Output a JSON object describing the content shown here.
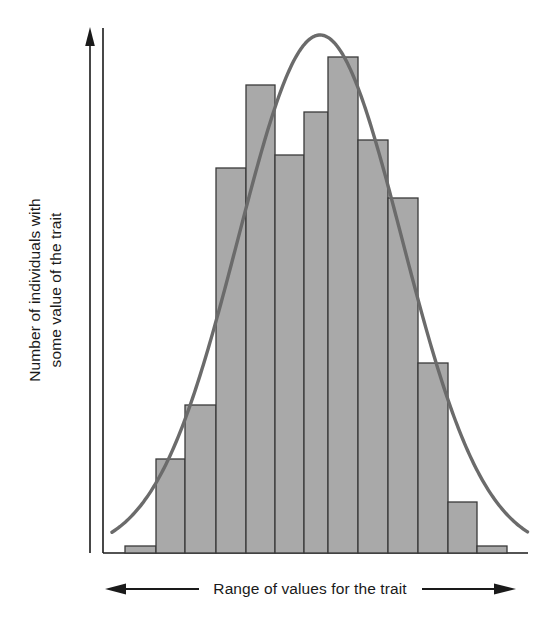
{
  "figure": {
    "kind": "histogram-with-normal-curve",
    "background_color": "#ffffff"
  },
  "axes": {
    "y": {
      "label_line1": "Number of individuals with",
      "label_line2": "some value of the trait",
      "arrow": "up-arrow-icon",
      "line_color": "#1a1a1a"
    },
    "x": {
      "label": "Range of values for the trait",
      "arrow_left": "left-arrow-icon",
      "arrow_right": "right-arrow-icon",
      "line_color": "#1a1a1a"
    }
  },
  "style": {
    "bar_fill": "#a9a9a9",
    "bar_stroke": "#3a3a3a",
    "curve_color": "#6b6b6b",
    "axis_color": "#1a1a1a",
    "text_color": "#1a1a1a"
  },
  "chart_data": {
    "type": "bar",
    "title": "",
    "xlabel": "Range of values for the trait",
    "ylabel": "Number of individuals with some value of the trait",
    "categories": [
      "1",
      "2",
      "3",
      "4",
      "5",
      "6",
      "7",
      "8",
      "9",
      "10",
      "11",
      "12",
      "13"
    ],
    "values": [
      3,
      22,
      35,
      89,
      109,
      93,
      103,
      116,
      96,
      82,
      44,
      12,
      3
    ],
    "ylim": [
      0,
      120
    ],
    "xlim": [
      0,
      13
    ],
    "grid": false,
    "legend": null,
    "bar_pixel_tops": [
      546,
      459,
      405,
      168,
      85,
      155,
      112,
      57,
      140,
      198,
      363,
      502,
      546
    ],
    "bar_pixel_edges": [
      125,
      156,
      185,
      216,
      246,
      275,
      304,
      328,
      358,
      388,
      418,
      448,
      477,
      507
    ],
    "baseline_pixel_y": 553,
    "overlay_curve": {
      "name": "normal-distribution-curve",
      "type": "line",
      "description": "smooth bell curve overlaid on the histogram",
      "peak_x_pixel": 320,
      "peak_y_pixel": 35,
      "color": "#6b6b6b"
    }
  }
}
